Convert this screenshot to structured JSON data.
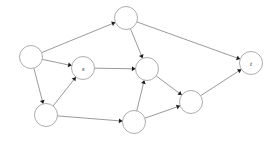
{
  "figure": {
    "background_color": "#ffffff",
    "node_fill": "#ffffff",
    "node_stroke": "#8a8a8a",
    "edge_color": "#6e6e6e",
    "arrow_color": "#1c1c1c",
    "label_color": "#2b2b2b"
  },
  "graph": {
    "type": "directed",
    "node_radius": 11.5,
    "nodes": [
      {
        "id": "n_left",
        "label": "",
        "cx": 31,
        "cy": 57
      },
      {
        "id": "n_top",
        "label": "",
        "cx": 126,
        "cy": 18
      },
      {
        "id": "n_s",
        "label": "s",
        "cx": 83,
        "cy": 68
      },
      {
        "id": "n_mid",
        "label": "",
        "cx": 147,
        "cy": 69
      },
      {
        "id": "n_t",
        "label": "t",
        "cx": 251,
        "cy": 63
      },
      {
        "id": "n_botleft",
        "label": "",
        "cx": 46,
        "cy": 115
      },
      {
        "id": "n_botmid",
        "label": "",
        "cx": 134,
        "cy": 122
      },
      {
        "id": "n_right",
        "label": "",
        "cx": 191,
        "cy": 102
      }
    ],
    "edges": [
      {
        "id": "e1",
        "from": "n_left",
        "to": "n_top"
      },
      {
        "id": "e2",
        "from": "n_left",
        "to": "n_s"
      },
      {
        "id": "e3",
        "from": "n_left",
        "to": "n_botleft"
      },
      {
        "id": "e4",
        "from": "n_top",
        "to": "n_t"
      },
      {
        "id": "e5",
        "from": "n_top",
        "to": "n_mid"
      },
      {
        "id": "e6",
        "from": "n_s",
        "to": "n_mid"
      },
      {
        "id": "e7",
        "from": "n_botleft",
        "to": "n_s"
      },
      {
        "id": "e8",
        "from": "n_botleft",
        "to": "n_botmid"
      },
      {
        "id": "e9",
        "from": "n_botmid",
        "to": "n_mid"
      },
      {
        "id": "e10",
        "from": "n_botmid",
        "to": "n_right"
      },
      {
        "id": "e11",
        "from": "n_mid",
        "to": "n_right"
      },
      {
        "id": "e12",
        "from": "n_right",
        "to": "n_t"
      }
    ]
  }
}
